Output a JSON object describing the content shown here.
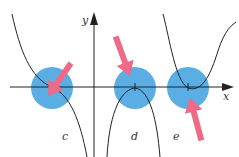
{
  "diagram": {
    "axes": {
      "x_label": "x",
      "y_label": "y"
    },
    "panels": [
      {
        "label": "c",
        "description": "point of inflection with horizontal tangent, curve decreasing"
      },
      {
        "label": "d",
        "description": "local maximum touching x-axis"
      },
      {
        "label": "e",
        "description": "local minimum touching x-axis"
      }
    ],
    "colors": {
      "highlight": "#5aaee3",
      "arrow": "#ee6a86",
      "curve": "#222222",
      "axis": "#222222"
    }
  }
}
